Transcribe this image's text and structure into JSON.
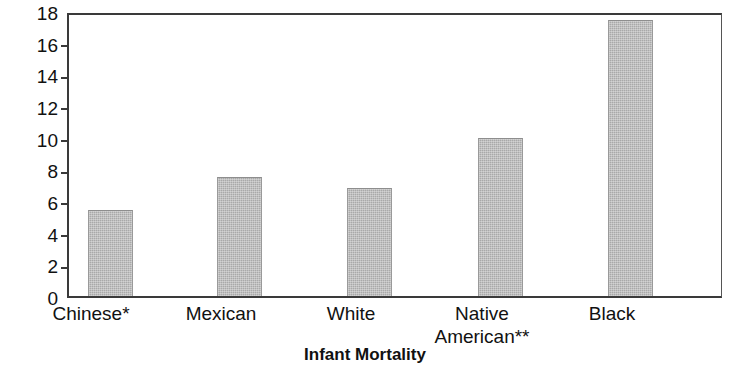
{
  "chart_data": {
    "type": "bar",
    "title": "",
    "xlabel": "Infant Mortality",
    "ylabel": "Rate per 1,000",
    "categories": [
      "Chinese*",
      "Mexican",
      "White",
      "Native American**",
      "Black"
    ],
    "category_lines": [
      [
        "Chinese*"
      ],
      [
        "Mexican"
      ],
      [
        "White"
      ],
      [
        "Native",
        "American**"
      ],
      [
        "Black"
      ]
    ],
    "values": [
      5.5,
      7.6,
      6.9,
      10.1,
      17.7
    ],
    "ylim": [
      0,
      18
    ],
    "yticks": [
      0,
      2,
      4,
      6,
      8,
      10,
      12,
      14,
      16,
      18
    ],
    "ytick_labels": [
      "0",
      "2",
      "4",
      "6",
      "8",
      "10",
      "12",
      "14",
      "16",
      "18"
    ],
    "grid": false,
    "legend": null,
    "bar_color": "#a9a9a9",
    "axis_color": "#3a3a3a",
    "footnote_markers": [
      "*",
      "**"
    ]
  }
}
